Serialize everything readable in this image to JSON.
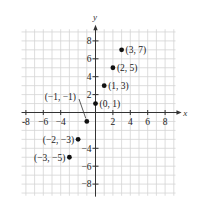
{
  "chart_data": {
    "type": "scatter",
    "title": "",
    "xlabel": "x",
    "ylabel": "y",
    "xlim": [
      -9,
      9
    ],
    "ylim": [
      -9,
      9
    ],
    "grid": true,
    "x_ticks": [
      -8,
      -6,
      -4,
      2,
      4,
      6,
      8
    ],
    "y_ticks": [
      8,
      6,
      4,
      2,
      -4,
      -6,
      -8
    ],
    "x_tick_labels": [
      "-8",
      "−6",
      "−4",
      "2",
      "4",
      "6",
      "8"
    ],
    "y_tick_labels": [
      "8",
      "6",
      "4",
      "2",
      "−4",
      "−6",
      "−8"
    ],
    "points": [
      {
        "x": -3,
        "y": -5,
        "label": "(−3, −5)"
      },
      {
        "x": -2,
        "y": -3,
        "label": "(−2, −3)"
      },
      {
        "x": -1,
        "y": -1,
        "label": "(−1, −1)"
      },
      {
        "x": 0,
        "y": 1,
        "label": "(0, 1)"
      },
      {
        "x": 1,
        "y": 3,
        "label": "(1, 3)"
      },
      {
        "x": 2,
        "y": 5,
        "label": "(2, 5)"
      },
      {
        "x": 3,
        "y": 7,
        "label": "(3, 7)"
      }
    ]
  }
}
